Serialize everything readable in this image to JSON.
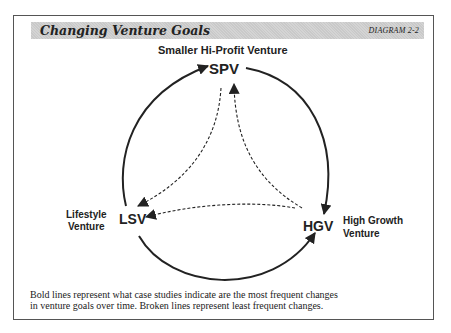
{
  "header": {
    "title": "Changing Venture Goals",
    "diagram_id": "DIAGRAM 2-2"
  },
  "nodes": {
    "spv": {
      "abbr": "SPV",
      "label": "Smaller Hi-Profit Venture"
    },
    "lsv": {
      "abbr": "LSV",
      "label_line1": "Lifestyle",
      "label_line2": "Venture"
    },
    "hgv": {
      "abbr": "HGV",
      "label_line1": "High Growth",
      "label_line2": "Venture"
    }
  },
  "edges": [
    {
      "from": "LSV",
      "to": "SPV",
      "style": "bold"
    },
    {
      "from": "SPV",
      "to": "HGV",
      "style": "bold"
    },
    {
      "from": "LSV",
      "to": "HGV",
      "style": "bold"
    },
    {
      "from": "SPV",
      "to": "LSV",
      "style": "dashed"
    },
    {
      "from": "HGV",
      "to": "SPV",
      "style": "dashed"
    },
    {
      "from": "HGV",
      "to": "LSV",
      "style": "dashed"
    }
  ],
  "caption": {
    "line1": "Bold lines represent what case studies  indicate are the most frequent changes",
    "line2": "in venture goals over time.  Broken lines represent  least frequent changes."
  },
  "colors": {
    "ink": "#222222",
    "title_bar": "#d4d4d4",
    "frame": "#555555"
  }
}
